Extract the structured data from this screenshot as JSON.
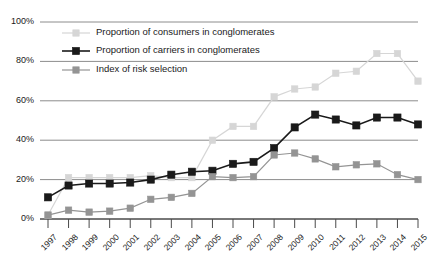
{
  "chart_data": {
    "type": "line",
    "title": "",
    "xlabel": "",
    "ylabel": "",
    "x": [
      1997,
      1998,
      1999,
      2000,
      2001,
      2002,
      2003,
      2004,
      2005,
      2006,
      2007,
      2008,
      2009,
      2010,
      2011,
      2012,
      2013,
      2014,
      2015
    ],
    "categories": [
      "1997",
      "1998",
      "1999",
      "2000",
      "2001",
      "2002",
      "2003",
      "2004",
      "2005",
      "2006",
      "2007",
      "2008",
      "2009",
      "2010",
      "2011",
      "2012",
      "2013",
      "2014",
      "2015"
    ],
    "ylim": [
      0,
      100
    ],
    "yticks": [
      0,
      20,
      40,
      60,
      80,
      100
    ],
    "ytick_labels": [
      "0%",
      "20%",
      "40%",
      "60%",
      "80%",
      "100%"
    ],
    "grid": true,
    "legend_position": "top-left-inside",
    "series": [
      {
        "name": "Proportion of consumers in conglomerates",
        "color": "#d6d6d6",
        "values": [
          2,
          21,
          21,
          21,
          21,
          22,
          21,
          21,
          40,
          47,
          47,
          62,
          66,
          67,
          74,
          75,
          84,
          84,
          70
        ]
      },
      {
        "name": "Proportion of carriers in conglomerates",
        "color": "#1a1a1a",
        "values": [
          11,
          17,
          18,
          18,
          18.5,
          20,
          22.5,
          24,
          24.5,
          28,
          29,
          36,
          46.5,
          53,
          50.5,
          47.5,
          51.5,
          51.5,
          48
        ]
      },
      {
        "name": "Index of risk selection",
        "color": "#949494",
        "values": [
          2,
          4.5,
          3.5,
          4,
          5.5,
          10,
          11,
          13,
          21.5,
          21,
          21.5,
          32.5,
          33.5,
          30.5,
          26.5,
          27.5,
          28,
          22.5,
          20
        ]
      }
    ]
  },
  "legend": {
    "items": [
      {
        "label": "Proportion of consumers in conglomerates",
        "color": "#d6d6d6"
      },
      {
        "label": "Proportion of carriers in conglomerates",
        "color": "#1a1a1a"
      },
      {
        "label": "Index of risk selection",
        "color": "#949494"
      }
    ]
  },
  "axes": {
    "y_labels": [
      "100%",
      "80%",
      "60%",
      "40%",
      "20%",
      "0%"
    ],
    "x_labels": [
      "1997",
      "1998",
      "1999",
      "2000",
      "2001",
      "2002",
      "2003",
      "2004",
      "2005",
      "2006",
      "2007",
      "2008",
      "2009",
      "2010",
      "2011",
      "2012",
      "2013",
      "2014",
      "2015"
    ]
  }
}
